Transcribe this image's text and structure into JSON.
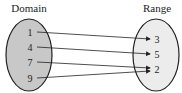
{
  "diagram": {
    "domain_title": "Domain",
    "range_title": "Range",
    "domain": [
      "1",
      "4",
      "7",
      "9"
    ],
    "range": [
      "3",
      "5",
      "2"
    ],
    "mappings": [
      {
        "from": "1",
        "to": "3"
      },
      {
        "from": "4",
        "to": "5"
      },
      {
        "from": "7",
        "to": "2"
      },
      {
        "from": "9",
        "to": "2"
      }
    ],
    "colors": {
      "domain_fill": "#c8c8c8",
      "range_fill": "#ececec",
      "stroke": "#222222"
    }
  }
}
